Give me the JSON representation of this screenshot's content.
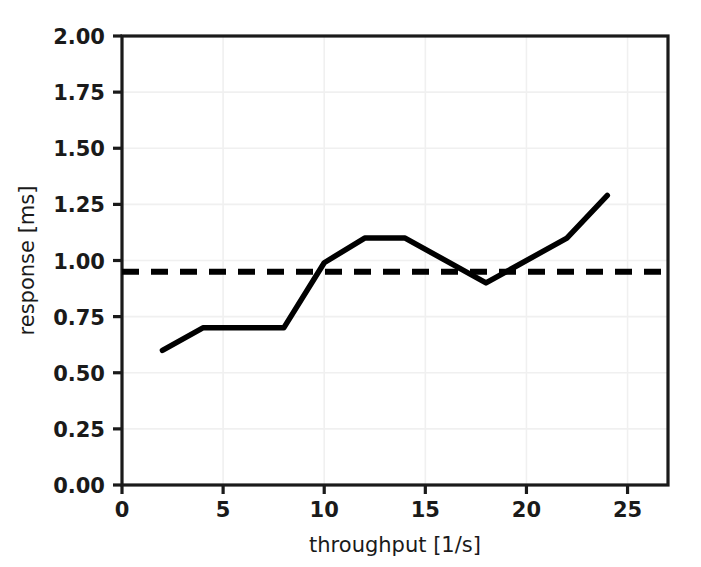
{
  "chart_data": {
    "type": "line",
    "title": "",
    "xlabel": "throughput [1/s]",
    "ylabel": "response [ms]",
    "xlim": [
      0,
      27
    ],
    "ylim": [
      0,
      2.0
    ],
    "grid": true,
    "legend_position": "none",
    "xticks": [
      "0",
      "5",
      "10",
      "15",
      "20",
      "25"
    ],
    "xtick_values": [
      0,
      5,
      10,
      15,
      20,
      25
    ],
    "yticks": [
      "0.00",
      "0.25",
      "0.50",
      "0.75",
      "1.00",
      "1.25",
      "1.50",
      "1.75",
      "2.00"
    ],
    "ytick_values": [
      0.0,
      0.25,
      0.5,
      0.75,
      1.0,
      1.25,
      1.5,
      1.75,
      2.0
    ],
    "series": [
      {
        "name": "response",
        "style": "solid",
        "color": "#000000",
        "x": [
          2,
          4,
          8,
          10,
          12,
          14,
          18,
          22,
          24
        ],
        "values": [
          0.6,
          0.7,
          0.7,
          0.99,
          1.1,
          1.1,
          0.9,
          1.1,
          1.29
        ]
      },
      {
        "name": "threshold",
        "style": "dashed",
        "color": "#000000",
        "x": [
          0,
          27
        ],
        "values": [
          0.95,
          0.95
        ]
      }
    ]
  },
  "axes": {
    "x_label": "throughput [1/s]",
    "y_label": "response [ms]"
  },
  "colors": {
    "line": "#000000",
    "threshold": "#000000",
    "grid": "#f0f0f0",
    "spine": "#1a1a1a",
    "background": "#ffffff"
  }
}
